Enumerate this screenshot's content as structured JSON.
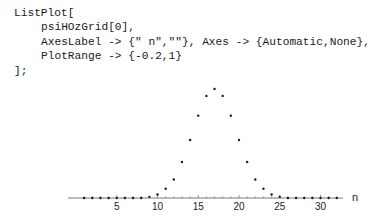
{
  "code": {
    "lines": [
      "ListPlot[",
      "psiHOzGrid[0],",
      "AxesLabel -> {\" n\",\"\"}, Axes -> {Automatic,None},",
      "PlotRange -> {-0.2,1}",
      "];"
    ]
  },
  "chart_data": {
    "type": "scatter",
    "title": "",
    "xlabel": "n",
    "ylabel": "",
    "xlim": [
      0,
      32
    ],
    "ylim": [
      -0.2,
      1
    ],
    "grid": false,
    "y_axis_shown": false,
    "x_ticks": [
      5,
      10,
      15,
      20,
      25,
      30
    ],
    "x": [
      1,
      2,
      3,
      4,
      5,
      6,
      7,
      8,
      9,
      10,
      11,
      12,
      13,
      14,
      15,
      16,
      17,
      18,
      19,
      20,
      21,
      22,
      23,
      24,
      25,
      26,
      27,
      28,
      29,
      30,
      31,
      32
    ],
    "values": [
      0,
      0,
      0,
      0,
      0,
      0,
      0,
      0,
      0.01,
      0.03,
      0.08,
      0.16,
      0.31,
      0.5,
      0.71,
      0.88,
      0.94,
      0.88,
      0.71,
      0.5,
      0.31,
      0.16,
      0.08,
      0.03,
      0.01,
      0,
      0,
      0,
      0,
      0,
      0,
      0
    ]
  },
  "colors": {
    "points": "#1a1a1a",
    "axis": "#555555"
  }
}
